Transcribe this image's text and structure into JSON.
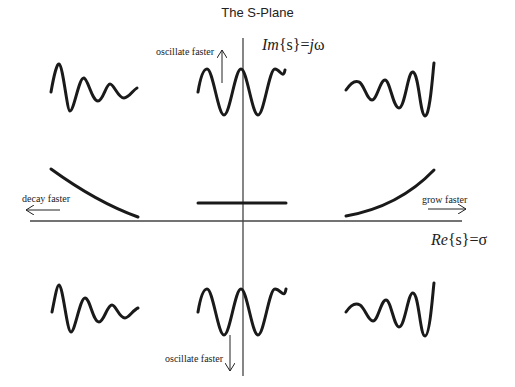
{
  "diagram": {
    "title": "The S-Plane",
    "axes": {
      "imaginary_label_prefix": "Im",
      "imaginary_label_arg": "{s}=",
      "imaginary_label_var": "j",
      "imaginary_label_omega": "ω",
      "real_label_prefix": "Re",
      "real_label_arg": "{s}=",
      "real_label_sigma": "σ"
    },
    "annotations": {
      "top": "oscillate faster",
      "bottom": "oscillate faster",
      "left": "decay faster",
      "right": "grow faster"
    },
    "regions": [
      {
        "position": "upper-left",
        "signal": "decaying oscillation"
      },
      {
        "position": "upper-center",
        "signal": "sustained oscillation"
      },
      {
        "position": "upper-right",
        "signal": "growing oscillation"
      },
      {
        "position": "middle-left",
        "signal": "exponential decay"
      },
      {
        "position": "middle-center",
        "signal": "constant"
      },
      {
        "position": "middle-right",
        "signal": "exponential growth"
      },
      {
        "position": "lower-left",
        "signal": "decaying oscillation"
      },
      {
        "position": "lower-center",
        "signal": "sustained oscillation"
      },
      {
        "position": "lower-right",
        "signal": "growing oscillation"
      }
    ],
    "colors": {
      "ink": "#1a1a1a",
      "axis": "#444444",
      "background": "#ffffff"
    }
  }
}
